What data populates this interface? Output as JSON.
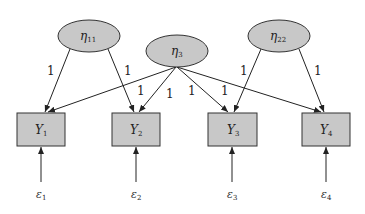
{
  "diagram": {
    "type": "path-diagram",
    "latent_factors": [
      {
        "id": "eta11",
        "symbol": "η",
        "subscript": "11",
        "cx": 89,
        "cy": 36
      },
      {
        "id": "eta3",
        "symbol": "η",
        "subscript": "3",
        "cx": 177,
        "cy": 51
      },
      {
        "id": "eta22",
        "symbol": "η",
        "subscript": "22",
        "cx": 279,
        "cy": 36
      }
    ],
    "observed_variables": [
      {
        "id": "Y1",
        "symbol": "Y",
        "subscript": "1",
        "x": 17,
        "y": 113
      },
      {
        "id": "Y2",
        "symbol": "Y",
        "subscript": "2",
        "x": 112,
        "y": 113
      },
      {
        "id": "Y3",
        "symbol": "Y",
        "subscript": "3",
        "x": 208,
        "y": 113
      },
      {
        "id": "Y4",
        "symbol": "Y",
        "subscript": "4",
        "x": 302,
        "y": 113
      }
    ],
    "errors": [
      {
        "id": "e1",
        "symbol": "ε",
        "subscript": "1"
      },
      {
        "id": "e2",
        "symbol": "ε",
        "subscript": "2"
      },
      {
        "id": "e3",
        "symbol": "ε",
        "subscript": "3"
      },
      {
        "id": "e4",
        "symbol": "ε",
        "subscript": "4"
      }
    ],
    "loadings": [
      {
        "from": "eta11",
        "to": "Y1",
        "label": "1"
      },
      {
        "from": "eta11",
        "to": "Y2",
        "label": "1"
      },
      {
        "from": "eta3",
        "to": "Y1",
        "label": "1"
      },
      {
        "from": "eta3",
        "to": "Y2",
        "label": "1"
      },
      {
        "from": "eta3",
        "to": "Y3",
        "label": "1"
      },
      {
        "from": "eta3",
        "to": "Y4",
        "label": "1"
      },
      {
        "from": "eta22",
        "to": "Y3",
        "label": "1"
      },
      {
        "from": "eta22",
        "to": "Y4",
        "label": "1"
      }
    ],
    "colors": {
      "node_fill": "#c8c8c8",
      "stroke": "#333333",
      "background": "#ffffff"
    }
  }
}
